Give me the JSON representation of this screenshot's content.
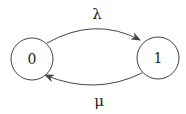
{
  "diagram": {
    "type": "state-transition",
    "states": [
      {
        "id": "state-0",
        "label": "0",
        "cx": 32,
        "cy": 59,
        "r": 21
      },
      {
        "id": "state-1",
        "label": "1",
        "cx": 158,
        "cy": 58,
        "r": 21
      }
    ],
    "transitions": [
      {
        "id": "transition-0-to-1",
        "from": "0",
        "to": "1",
        "label": "λ",
        "path": "M 47 43 Q 95 16 140 40",
        "label_x": 97,
        "label_y": 19
      },
      {
        "id": "transition-1-to-0",
        "from": "1",
        "to": "0",
        "label": "μ",
        "path": "M 142 73 Q 95 96 45 75",
        "label_x": 99,
        "label_y": 106
      }
    ],
    "stroke_color": "#444444"
  }
}
